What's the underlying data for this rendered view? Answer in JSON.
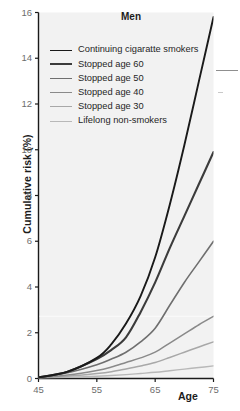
{
  "figure": {
    "title": "Men",
    "background_color": "#ffffff",
    "plot_background_color": "#f2f2f2",
    "axis_color": "#1a1a1a",
    "tick_label_color": "#6d6d6d",
    "title_color": "#1c1c1c"
  },
  "axis": {
    "ylabel": "Cumulative risk (%)",
    "xlabel": "Age",
    "yticks": [
      "0",
      "2",
      "4",
      "6",
      "8",
      "10",
      "12",
      "14",
      "16"
    ],
    "xticks": [
      "45",
      "55",
      "65",
      "75"
    ]
  },
  "legend": {
    "items": [
      {
        "label": "Continuing cigaratte smokers",
        "color": "#1a1a1a",
        "width": "1.9"
      },
      {
        "label": "Stopped age 60",
        "color": "#3c3c3c",
        "width": "2.2"
      },
      {
        "label": "Stopped age 50",
        "color": "#6f6f6f",
        "width": "1.5"
      },
      {
        "label": "Stopped age 40",
        "color": "#8a8a8a",
        "width": "1.4"
      },
      {
        "label": "Stopped age 30",
        "color": "#a8a8a8",
        "width": "1.4"
      },
      {
        "label": "Lifelong non-smokers",
        "color": "#b8b8b8",
        "width": "1.3"
      }
    ]
  },
  "chart_data": {
    "type": "line",
    "title": "Men",
    "xlabel": "Age",
    "ylabel": "Cumulative risk (%)",
    "xlim": [
      45,
      75
    ],
    "ylim": [
      0,
      16
    ],
    "xticks": [
      45,
      55,
      65,
      75
    ],
    "yticks": [
      0,
      2,
      4,
      6,
      8,
      10,
      12,
      14,
      16
    ],
    "grid": false,
    "legend_position": "upper-left-inside",
    "x": [
      45,
      50,
      55,
      57.5,
      60,
      62.5,
      65,
      67.5,
      70,
      72.5,
      75
    ],
    "series": [
      {
        "name": "Continuing cigaratte smokers",
        "color": "#1a1a1a",
        "values": [
          0.05,
          0.3,
          0.9,
          1.5,
          2.4,
          3.6,
          5.3,
          7.6,
          10.2,
          13.0,
          15.8
        ]
      },
      {
        "name": "Stopped age 60",
        "color": "#3c3c3c",
        "values": [
          0.05,
          0.3,
          0.85,
          1.25,
          1.8,
          2.9,
          4.2,
          5.7,
          7.1,
          8.5,
          9.9
        ]
      },
      {
        "name": "Stopped age 50",
        "color": "#6f6f6f",
        "values": [
          0.05,
          0.25,
          0.6,
          0.85,
          1.15,
          1.6,
          2.2,
          3.2,
          4.2,
          5.1,
          6.0
        ]
      },
      {
        "name": "Stopped age 40",
        "color": "#8a8a8a",
        "values": [
          0.04,
          0.15,
          0.35,
          0.5,
          0.7,
          0.9,
          1.15,
          1.55,
          1.95,
          2.35,
          2.72
        ]
      },
      {
        "name": "Stopped age 30",
        "color": "#a8a8a8",
        "values": [
          0.03,
          0.1,
          0.22,
          0.3,
          0.42,
          0.55,
          0.7,
          0.92,
          1.15,
          1.38,
          1.6
        ]
      },
      {
        "name": "Lifelong non-smokers",
        "color": "#b8b8b8",
        "values": [
          0.02,
          0.05,
          0.1,
          0.13,
          0.17,
          0.22,
          0.27,
          0.34,
          0.41,
          0.48,
          0.55
        ]
      }
    ]
  }
}
